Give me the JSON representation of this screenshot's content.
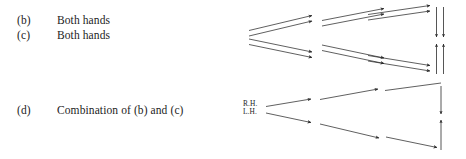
{
  "figure": {
    "background_color": "#ffffff",
    "ink_color": "#2b2b2b",
    "width": 466,
    "height": 159
  },
  "rows": [
    {
      "tag": "(b)",
      "description": "Both hands"
    },
    {
      "tag": "(c)",
      "description": "Both hands"
    },
    {
      "tag": "(d)",
      "description": "Combination of (b) and (c)"
    }
  ],
  "hand_labels": {
    "right": "R.H.",
    "left": "L.H."
  },
  "diagram": {
    "upper_group": {
      "description": "Two pairs of double arrows diverging right, each pair continuing in three ascending or descending segments into a vertical double arrow",
      "arrow_style": "double-line",
      "segments_per_path": 3,
      "vertical_arrows": [
        {
          "direction": "down",
          "count": 2
        },
        {
          "direction": "up",
          "count": 2
        }
      ]
    },
    "lower_group": {
      "description": "Single arrows from R.H. and L.H. zigzagging right into single vertical arrows",
      "arrow_style": "single-line",
      "segments_per_path": 3,
      "vertical_arrows": [
        {
          "direction": "down",
          "count": 1
        },
        {
          "direction": "up",
          "count": 1
        }
      ]
    }
  }
}
